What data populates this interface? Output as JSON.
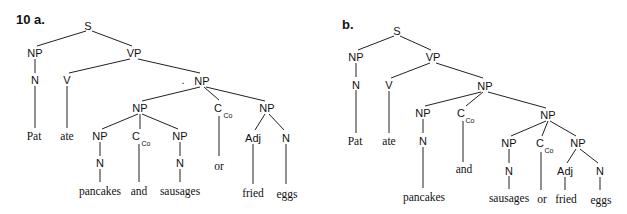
{
  "figure": {
    "number": "10",
    "trees": [
      {
        "label": "10 a.",
        "nodes": {
          "S": "S",
          "NP_subj": "NP",
          "N_subj": "N",
          "w_pat": "Pat",
          "VP": "VP",
          "V": "V",
          "w_ate": "ate",
          "NP_obj": "NP",
          "NP_conj": "NP",
          "NP_pan": "NP",
          "N_pan": "N",
          "w_pancakes": "pancakes",
          "C_and": "C",
          "C_and_sub": "Co",
          "w_and": "and",
          "NP_saus": "NP",
          "N_saus": "N",
          "w_sausages": "sausages",
          "C_or": "C",
          "C_or_sub": "Co",
          "w_or": "or",
          "NP_eggs": "NP",
          "Adj": "Adj",
          "N_eggs": "N",
          "w_fried": "fried",
          "w_eggs": "eggs"
        }
      },
      {
        "label": "b.",
        "nodes": {
          "S": "S",
          "NP_subj": "NP",
          "N_subj": "N",
          "w_pat": "Pat",
          "VP": "VP",
          "V": "V",
          "w_ate": "ate",
          "NP_obj": "NP",
          "NP_pan": "NP",
          "N_pan": "N",
          "w_pancakes": "pancakes",
          "C_and": "C",
          "C_and_sub": "Co",
          "w_and": "and",
          "NP_conj": "NP",
          "NP_saus": "NP",
          "N_saus": "N",
          "w_sausages": "sausages",
          "C_or": "C",
          "C_or_sub": "Co",
          "w_or": "or",
          "NP_eggs": "NP",
          "Adj": "Adj",
          "N_eggs": "N",
          "w_fried": "fried",
          "w_eggs": "eggs"
        }
      }
    ],
    "sentence": "Pat ate pancakes and sausages or fried eggs"
  }
}
